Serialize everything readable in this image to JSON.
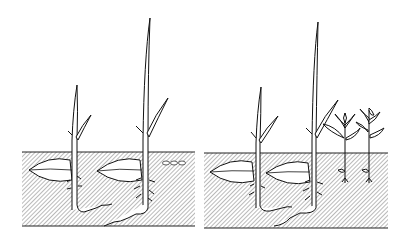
{
  "figure": {
    "title": "Seed germination comparison",
    "panels": [
      {
        "id": "left",
        "label": "Panel A",
        "soil": {
          "x": 22,
          "y": 152,
          "w": 173,
          "h": 74
        },
        "seeds": [
          {
            "name": "seed-1",
            "cx": 52,
            "cy": 170
          },
          {
            "name": "seed-2",
            "cx": 120,
            "cy": 170
          }
        ],
        "seedlings": [
          {
            "name": "short-seedling",
            "stemX": 75,
            "topY": 85
          },
          {
            "name": "tall-seedling",
            "stemX": 145,
            "topY": 18
          }
        ],
        "pellets": 3
      },
      {
        "id": "right",
        "label": "Panel B",
        "soil": {
          "x": 204,
          "y": 153,
          "w": 184,
          "h": 75
        },
        "seeds": [
          {
            "name": "seed-3",
            "cx": 236,
            "cy": 172
          },
          {
            "name": "seed-4",
            "cx": 292,
            "cy": 173
          }
        ],
        "seedlings": [
          {
            "name": "short-seedling",
            "stemX": 258,
            "topY": 87
          },
          {
            "name": "tall-seedling",
            "stemX": 314,
            "topY": 22
          },
          {
            "name": "leafy-sprout-1",
            "stemX": 345,
            "topY": 108
          },
          {
            "name": "leafy-sprout-2",
            "stemX": 370,
            "topY": 106
          }
        ]
      }
    ],
    "colors": {
      "ink": "#1a1a1a",
      "background": "#ffffff",
      "hatch": "#555555"
    }
  }
}
